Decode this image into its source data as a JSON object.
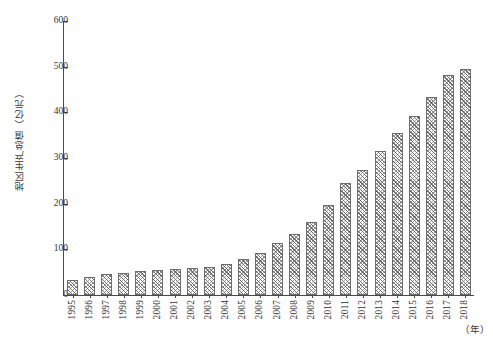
{
  "chart_data": {
    "type": "bar",
    "title": "",
    "subtitle": "",
    "xlabel": "（年）",
    "ylabel": "地区生产总值（亿元）",
    "categories": [
      "1995",
      "1996",
      "1997",
      "1998",
      "1999",
      "2000",
      "2001",
      "2002",
      "2003",
      "2004",
      "2005",
      "2006",
      "2007",
      "2008",
      "2009",
      "2010",
      "2011",
      "2012",
      "2013",
      "2014",
      "2015",
      "2016",
      "2017",
      "2018"
    ],
    "values": [
      33,
      40,
      45,
      48,
      52,
      55,
      58,
      60,
      62,
      68,
      78,
      92,
      113,
      133,
      160,
      198,
      245,
      274,
      316,
      355,
      392,
      434,
      481,
      495
    ],
    "ylim": [
      0,
      600
    ],
    "ytick_labels": [
      "0",
      "100",
      "200",
      "300",
      "400",
      "500",
      "600"
    ],
    "ytick_values": [
      0,
      100,
      200,
      300,
      400,
      500,
      600
    ],
    "grid": false,
    "legend": null,
    "legend_position": "none",
    "bar_fill": "hatched-crosshatch",
    "bar_edge_color": "#6d6d6d",
    "axis_color": "#4a4a4a",
    "background": "#ffffff"
  }
}
